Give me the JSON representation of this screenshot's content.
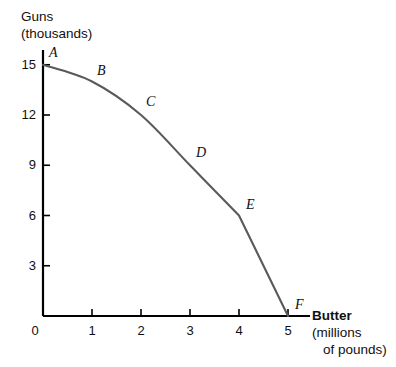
{
  "chart_data": {
    "type": "line",
    "title": "",
    "xlabel": "Butter (millions of pounds)",
    "ylabel": "Guns (thousands)",
    "xlabel_bold_part": "Butter",
    "xlabel_line2": "(millions",
    "xlabel_line3": "of pounds)",
    "ylabel_line1": "Guns",
    "ylabel_line2": "(thousands)",
    "x": [
      0,
      1,
      2,
      3,
      4,
      5
    ],
    "values": [
      15,
      14,
      12,
      9,
      6,
      0
    ],
    "point_labels": [
      "A",
      "B",
      "C",
      "D",
      "E",
      "F"
    ],
    "xlim": [
      0,
      5.2
    ],
    "ylim": [
      0,
      16.2
    ],
    "xticks": [
      0,
      1,
      2,
      3,
      4,
      5
    ],
    "xtick_labels": [
      "0",
      "1",
      "2",
      "3",
      "4",
      "5"
    ],
    "yticks": [
      3,
      6,
      9,
      12,
      15
    ],
    "ytick_labels": [
      "3",
      "6",
      "9",
      "12",
      "15"
    ],
    "origin_label": "0",
    "grid": false,
    "legend": false,
    "curve_color": "#5a5a5a",
    "axis_color": "#000000",
    "text_color": "#101010"
  }
}
